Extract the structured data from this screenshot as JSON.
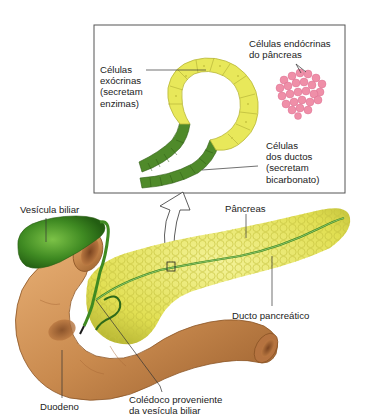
{
  "inset": {
    "exocrine_label": [
      "Células",
      "exócrinas",
      "(secretam",
      "enzimas)"
    ],
    "endocrine_label": [
      "Células endócrinas",
      "do pâncreas"
    ],
    "duct_cells_label": [
      "Células",
      "dos ductos",
      "(secretam",
      "bicarbonato)"
    ]
  },
  "anatomy": {
    "gallbladder_label": "Vesícula biliar",
    "pancreas_label": "Pâncreas",
    "pancreatic_duct_label": "Ducto pancreático",
    "duodenum_label": "Duodeno",
    "common_bile_duct_label": [
      "Colédoco proveniente",
      "da vesícula biliar"
    ]
  },
  "colors": {
    "acinar_yellow": "#e8e85a",
    "duct_green": "#4f8a2a",
    "endocrine_pink": "#ef8fa8",
    "duodenum_tan": "#c98a4e",
    "gallbladder_green": "#3f8a22",
    "pancreas_yellow": "#e4e35a",
    "box_border": "#555555"
  }
}
